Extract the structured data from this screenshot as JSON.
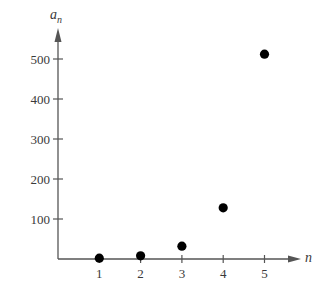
{
  "chart_data": {
    "type": "scatter",
    "title": "",
    "xlabel": "n",
    "ylabel": "a_n",
    "ylabel_main": "a",
    "ylabel_sub": "n",
    "x": [
      1,
      2,
      3,
      4,
      5
    ],
    "values": [
      2,
      8,
      32,
      128,
      512
    ],
    "series": [
      {
        "name": "a_n",
        "x": [
          1,
          2,
          3,
          4,
          5
        ],
        "values": [
          2,
          8,
          32,
          128,
          512
        ]
      }
    ],
    "xticks": [
      "1",
      "2",
      "3",
      "4",
      "5"
    ],
    "yticks": [
      "100",
      "200",
      "300",
      "400",
      "500"
    ],
    "xlim": [
      0,
      5.8
    ],
    "ylim": [
      0,
      560
    ],
    "grid": false,
    "legend": null,
    "marker_color": "#000000",
    "axis_color": "#555555"
  }
}
